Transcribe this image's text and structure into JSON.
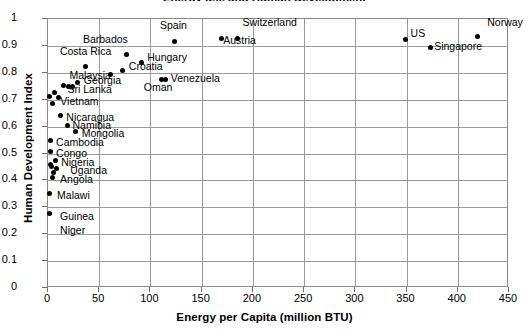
{
  "chart_data": {
    "type": "scatter",
    "title": "Energy use and Human Development",
    "xlabel": "Energy per Capita (million BTU)",
    "ylabel": "Human Development Index",
    "xlim": [
      0,
      450
    ],
    "ylim": [
      0,
      1
    ],
    "xticks": [
      0,
      50,
      100,
      150,
      200,
      250,
      300,
      350,
      400,
      450
    ],
    "yticks": [
      0,
      0.1,
      0.2,
      0.3,
      0.4,
      0.5,
      0.6,
      0.7,
      0.8,
      0.9,
      1
    ],
    "grid": true,
    "legend": "none",
    "marker_color": "#000000",
    "points": [
      {
        "label": "Norway",
        "x": 420,
        "y": 0.93,
        "lx": 10,
        "ly": -15,
        "anchor": "center"
      },
      {
        "label": "US",
        "x": 350,
        "y": 0.921,
        "lx": 5,
        "ly": -6,
        "anchor": "left"
      },
      {
        "label": "Singapore",
        "x": 374,
        "y": 0.89,
        "lx": 4,
        "ly": -2,
        "anchor": "left"
      },
      {
        "label": "Switzerland",
        "x": 186,
        "y": 0.925,
        "lx": 5,
        "ly": -16,
        "anchor": "left"
      },
      {
        "label": "Austria",
        "x": 170,
        "y": 0.925,
        "lx": 2,
        "ly": 2,
        "anchor": "left"
      },
      {
        "label": "Spain",
        "x": 124,
        "y": 0.912,
        "lx": -14,
        "ly": -17,
        "anchor": "left"
      },
      {
        "label": "Barbados",
        "x": 78,
        "y": 0.865,
        "lx": -44,
        "ly": -15,
        "anchor": "left"
      },
      {
        "label": "Costa Rica",
        "x": 38,
        "y": 0.821,
        "lx": -26,
        "ly": -15,
        "anchor": "left"
      },
      {
        "label": "Hungary",
        "x": 92,
        "y": 0.836,
        "lx": 6,
        "ly": -5,
        "anchor": "left"
      },
      {
        "label": "Croatia",
        "x": 74,
        "y": 0.805,
        "lx": 6,
        "ly": -4,
        "anchor": "left"
      },
      {
        "label": "Malaysia",
        "x": 62,
        "y": 0.79,
        "lx": -41,
        "ly": 1,
        "anchor": "left"
      },
      {
        "label": "Venezuela",
        "x": 116,
        "y": 0.772,
        "lx": 5,
        "ly": -1,
        "anchor": "left"
      },
      {
        "label": "Oman",
        "x": 112,
        "y": 0.77,
        "lx": -18,
        "ly": 7,
        "anchor": "left"
      },
      {
        "label": "Georgia",
        "x": 30,
        "y": 0.762,
        "lx": 6,
        "ly": -2,
        "anchor": "left"
      },
      {
        "label": "Sri Lanka",
        "x": 21,
        "y": 0.745,
        "lx": -1,
        "ly": 2,
        "anchor": "left"
      },
      {
        "label": "Vietnam",
        "x": 11,
        "y": 0.704,
        "lx": 2,
        "ly": 3,
        "anchor": "left"
      },
      {
        "label": "Nicaragua",
        "x": 13,
        "y": 0.636,
        "lx": 6,
        "ly": 1,
        "anchor": "left"
      },
      {
        "label": "Namibia",
        "x": 20,
        "y": 0.602,
        "lx": 5,
        "ly": 0,
        "anchor": "left"
      },
      {
        "label": "Mongolia",
        "x": 28,
        "y": 0.578,
        "lx": 6,
        "ly": 1,
        "anchor": "left"
      },
      {
        "label": "Cambodia",
        "x": 3,
        "y": 0.543,
        "lx": 6,
        "ly": 1,
        "anchor": "left"
      },
      {
        "label": "Congo",
        "x": 3,
        "y": 0.502,
        "lx": 6,
        "ly": 1,
        "anchor": "left"
      },
      {
        "label": "Nigeria",
        "x": 8,
        "y": 0.47,
        "lx": 6,
        "ly": 1,
        "anchor": "left"
      },
      {
        "label": "Uganda",
        "x": 9,
        "y": 0.44,
        "lx": 14,
        "ly": 1,
        "anchor": "left"
      },
      {
        "label": "Angola",
        "x": 5,
        "y": 0.406,
        "lx": 8,
        "ly": 1,
        "anchor": "left"
      },
      {
        "label": "Malawi",
        "x": 2,
        "y": 0.346,
        "lx": 8,
        "ly": 1,
        "anchor": "left"
      },
      {
        "label": "Guinea",
        "x": 2,
        "y": 0.273,
        "lx": 11,
        "ly": 2,
        "anchor": "left"
      },
      {
        "label": "Niger",
        "x": 2,
        "y": 0.273,
        "lx": 11,
        "ly": 16,
        "anchor": "left",
        "hide_marker": true
      }
    ],
    "extra_points": [
      {
        "x": 2,
        "y": 0.71
      },
      {
        "x": 7,
        "y": 0.722
      },
      {
        "x": 16,
        "y": 0.748
      },
      {
        "x": 5,
        "y": 0.681
      },
      {
        "x": 25,
        "y": 0.745
      },
      {
        "x": 4,
        "y": 0.449
      },
      {
        "x": 6,
        "y": 0.425
      },
      {
        "x": 3,
        "y": 0.455
      }
    ]
  }
}
